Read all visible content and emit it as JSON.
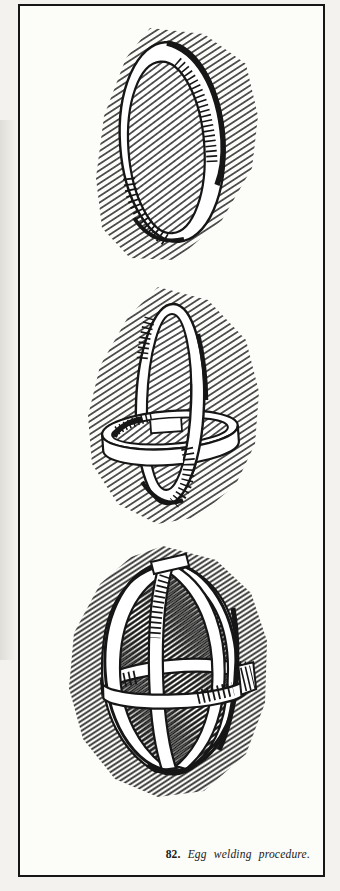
{
  "page": {
    "type": "scanned book figure",
    "colors": {
      "ink": "#161616",
      "paper": "#fcfcf9",
      "margin": "#f3f2ee"
    }
  },
  "figure": {
    "caption": {
      "number": "82.",
      "text": "Egg welding procedure."
    },
    "steps": [
      {
        "name": "single-ring-drawing"
      },
      {
        "name": "crossed-rings-drawing"
      },
      {
        "name": "egg-cage-drawing"
      }
    ]
  }
}
